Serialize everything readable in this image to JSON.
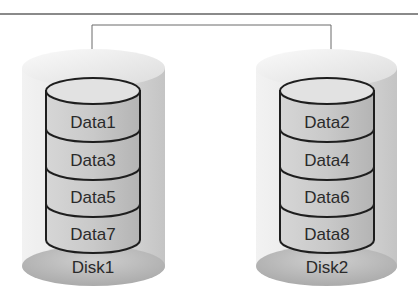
{
  "diagram": {
    "type": "RAID 0 striping",
    "colors": {
      "rule": "#8a8a8a",
      "connector": "#6a6a6a",
      "outer_top": "#ebebeb",
      "outer_body": "#d9d9d9",
      "outer_base": "#b8b8b8",
      "inner_top": "#e4e4e4",
      "inner_band": "#c8c8c8",
      "outline": "#1e1e1e",
      "text": "#2a2a2a"
    },
    "disks": [
      {
        "name": "Disk1",
        "blocks": [
          "Data1",
          "Data3",
          "Data5",
          "Data7"
        ]
      },
      {
        "name": "Disk2",
        "blocks": [
          "Data2",
          "Data4",
          "Data6",
          "Data8"
        ]
      }
    ]
  }
}
